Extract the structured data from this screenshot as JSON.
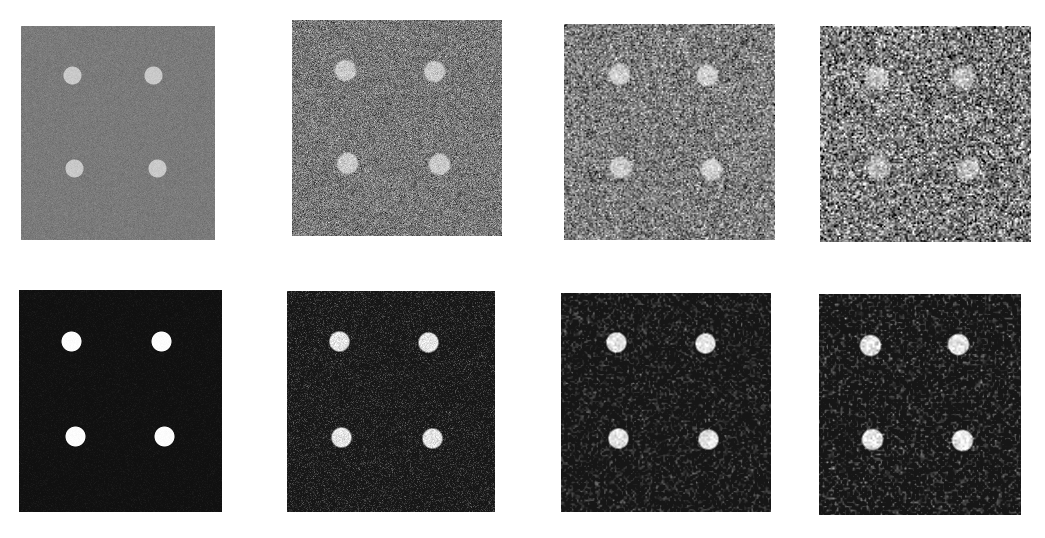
{
  "figure": {
    "background": "#ffffff",
    "rows": [
      {
        "label": "noisy-inputs",
        "panels": [
          {
            "id": "top-1",
            "x": 21,
            "y": 26,
            "w": 194,
            "h": 214,
            "bg": 122,
            "noise": 6,
            "grain": 1,
            "dot_value": 200,
            "dot_noise": 4,
            "dot_radius": 9,
            "dot_blur": 0.5,
            "dots": [
              [
                72,
                75
              ],
              [
                153,
                75
              ],
              [
                74,
                168
              ],
              [
                157,
                168
              ]
            ]
          },
          {
            "id": "top-2",
            "x": 292,
            "y": 20,
            "w": 210,
            "h": 216,
            "bg": 120,
            "noise": 28,
            "grain": 1,
            "dot_value": 200,
            "dot_noise": 14,
            "dot_radius": 10.5,
            "dot_blur": 1.2,
            "dots": [
              [
                345,
                70
              ],
              [
                434,
                71
              ],
              [
                347,
                163
              ],
              [
                439,
                164
              ]
            ]
          },
          {
            "id": "top-3",
            "x": 564,
            "y": 24,
            "w": 211,
            "h": 216,
            "bg": 125,
            "noise": 48,
            "grain": 1.4,
            "dot_value": 205,
            "dot_noise": 22,
            "dot_radius": 10.5,
            "dot_blur": 1.6,
            "dots": [
              [
                619,
                74
              ],
              [
                707,
                75
              ],
              [
                620,
                167
              ],
              [
                711,
                169
              ]
            ]
          },
          {
            "id": "top-4",
            "x": 820,
            "y": 26,
            "w": 211,
            "h": 216,
            "bg": 122,
            "noise": 70,
            "grain": 1.6,
            "dot_value": 190,
            "dot_noise": 36,
            "dot_radius": 11,
            "dot_blur": 2.5,
            "dots": [
              [
                876,
                77
              ],
              [
                963,
                77
              ],
              [
                877,
                168
              ],
              [
                968,
                169
              ]
            ]
          }
        ]
      },
      {
        "label": "processed-outputs",
        "panels": [
          {
            "id": "bottom-1",
            "x": 19,
            "y": 290,
            "w": 203,
            "h": 222,
            "bg": 16,
            "noise": 5,
            "grain": 1,
            "dot_value": 252,
            "dot_noise": 2,
            "dot_radius": 10,
            "dot_blur": 0.4,
            "dots": [
              [
                71,
                341
              ],
              [
                161,
                341
              ],
              [
                75,
                436
              ],
              [
                164,
                436
              ]
            ]
          },
          {
            "id": "bottom-2",
            "x": 287,
            "y": 291,
            "w": 208,
            "h": 221,
            "bg": 22,
            "noise": 26,
            "grain": 1,
            "dot_value": 228,
            "dot_noise": 14,
            "dot_radius": 10,
            "dot_blur": 0.9,
            "dots": [
              [
                339,
                341
              ],
              [
                428,
                342
              ],
              [
                341,
                437
              ],
              [
                432,
                438
              ]
            ]
          },
          {
            "id": "bottom-3",
            "x": 561,
            "y": 293,
            "w": 210,
            "h": 219,
            "bg": 22,
            "noise": 34,
            "grain": 1.8,
            "dot_value": 228,
            "dot_noise": 20,
            "dot_radius": 10,
            "dot_blur": 1.0,
            "dots": [
              [
                616,
                342
              ],
              [
                705,
                343
              ],
              [
                618,
                438
              ],
              [
                708,
                439
              ]
            ]
          },
          {
            "id": "bottom-4",
            "x": 819,
            "y": 294,
            "w": 202,
            "h": 221,
            "bg": 22,
            "noise": 38,
            "grain": 2,
            "dot_value": 228,
            "dot_noise": 22,
            "dot_radius": 10.5,
            "dot_blur": 1.0,
            "dots": [
              [
                870,
                345
              ],
              [
                958,
                344
              ],
              [
                872,
                439
              ],
              [
                962,
                440
              ]
            ]
          }
        ]
      }
    ]
  }
}
